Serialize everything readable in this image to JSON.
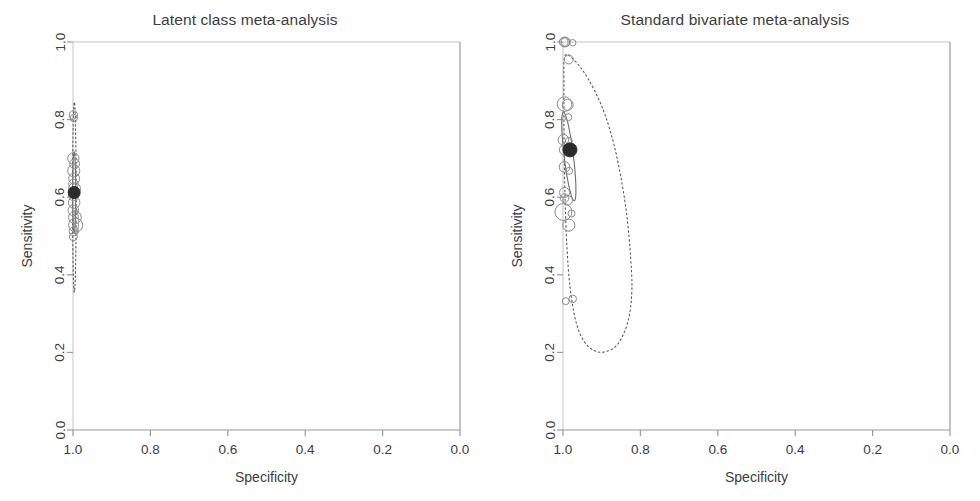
{
  "figure": {
    "width": 980,
    "height": 501,
    "background": "#ffffff",
    "panel_count": 2
  },
  "panels": [
    {
      "id": "latent-class",
      "title": "Latent class meta-analysis",
      "xlabel": "Specificity",
      "ylabel": "Sensitivity"
    },
    {
      "id": "standard-bivariate",
      "title": "Standard bivariate meta-analysis",
      "xlabel": "Specificity",
      "ylabel": "Sensitivity"
    }
  ],
  "axes": {
    "x_ticks": [
      "1.0",
      "0.8",
      "0.6",
      "0.4",
      "0.2",
      "0.0"
    ],
    "x_tick_values": [
      1.0,
      0.8,
      0.6,
      0.4,
      0.2,
      0.0
    ],
    "y_ticks": [
      "0.0",
      "0.2",
      "0.4",
      "0.6",
      "0.8",
      "1.0"
    ],
    "y_tick_values": [
      0.0,
      0.2,
      0.4,
      0.6,
      0.8,
      1.0
    ],
    "x_reversed": true,
    "xlim": [
      1.0,
      0.0
    ],
    "ylim": [
      0.0,
      1.0
    ],
    "grid": false,
    "axis_color": "#9a9a9a",
    "text_color": "#3d3d3d"
  },
  "chart_data": [
    {
      "type": "scatter",
      "id": "latent-class",
      "title": "Latent class meta-analysis",
      "xlabel": "Specificity",
      "ylabel": "Sensitivity",
      "xlim": [
        1.0,
        0.0
      ],
      "ylim": [
        0.0,
        1.0
      ],
      "x_reversed": true,
      "grid": false,
      "legend": "none",
      "notes": "SROC plot. Study circles sized by study weight, summary operating point (filled), 95% confidence ellipse (solid), 95% prediction region (dotted).",
      "summary_point": {
        "specificity": 0.997,
        "sensitivity": 0.612,
        "marker": "filled-circle",
        "color": "#2b2b2b",
        "radius_px": 6
      },
      "confidence_region": {
        "style": "solid",
        "color": "#6f6f6f",
        "center": [
          0.997,
          0.612
        ],
        "spec_half_width": 0.004,
        "sens_half_height": 0.105
      },
      "prediction_region": {
        "style": "dotted",
        "color": "#5a5a5a",
        "center": [
          0.9965,
          0.6
        ],
        "spec_half_width": 0.0085,
        "sens_half_height": 0.245,
        "sens_range": [
          0.34,
          0.81
        ]
      },
      "series": [
        {
          "name": "studies",
          "points": [
            {
              "specificity": 0.999,
              "sensitivity": 0.812,
              "weight": 0.8
            },
            {
              "specificity": 0.998,
              "sensitivity": 0.804,
              "weight": 0.5
            },
            {
              "specificity": 0.999,
              "sensitivity": 0.7,
              "weight": 2.4
            },
            {
              "specificity": 0.996,
              "sensitivity": 0.686,
              "weight": 1.6
            },
            {
              "specificity": 0.998,
              "sensitivity": 0.668,
              "weight": 3.0
            },
            {
              "specificity": 0.997,
              "sensitivity": 0.648,
              "weight": 2.2
            },
            {
              "specificity": 0.999,
              "sensitivity": 0.634,
              "weight": 1.4
            },
            {
              "specificity": 0.996,
              "sensitivity": 0.622,
              "weight": 2.8
            },
            {
              "specificity": 0.998,
              "sensitivity": 0.604,
              "weight": 1.8
            },
            {
              "specificity": 0.997,
              "sensitivity": 0.586,
              "weight": 2.6
            },
            {
              "specificity": 0.999,
              "sensitivity": 0.566,
              "weight": 2.0
            },
            {
              "specificity": 0.995,
              "sensitivity": 0.548,
              "weight": 3.4
            },
            {
              "specificity": 0.993,
              "sensitivity": 0.528,
              "weight": 4.6
            },
            {
              "specificity": 0.998,
              "sensitivity": 0.512,
              "weight": 1.2
            },
            {
              "specificity": 0.999,
              "sensitivity": 0.498,
              "weight": 0.7
            }
          ]
        }
      ]
    },
    {
      "type": "scatter",
      "id": "standard-bivariate",
      "title": "Standard bivariate meta-analysis",
      "xlabel": "Specificity",
      "ylabel": "Sensitivity",
      "xlim": [
        1.0,
        0.0
      ],
      "ylim": [
        0.0,
        1.0
      ],
      "x_reversed": true,
      "grid": false,
      "legend": "none",
      "notes": "SROC plot. Study circles sized by study weight, summary operating point (filled), 95% confidence ellipse (solid, tilted), wide 95% prediction region (dotted) reaching specificity ~0.82 and sensitivity ~0.20.",
      "summary_point": {
        "specificity": 0.982,
        "sensitivity": 0.722,
        "marker": "filled-circle",
        "color": "#2b2b2b",
        "radius_px": 7
      },
      "confidence_region": {
        "style": "solid",
        "color": "#6f6f6f",
        "center": [
          0.985,
          0.705
        ],
        "spec_half_width": 0.012,
        "sens_half_height": 0.115,
        "tilted": true
      },
      "prediction_region": {
        "style": "dotted",
        "color": "#5a5a5a",
        "center": [
          0.94,
          0.6
        ],
        "spec_range": [
          0.82,
          0.995
        ],
        "sens_range": [
          0.2,
          0.965
        ]
      },
      "series": [
        {
          "name": "studies",
          "points": [
            {
              "specificity": 0.998,
              "sensitivity": 1.0,
              "weight": 1.0
            },
            {
              "specificity": 0.996,
              "sensitivity": 1.0,
              "weight": 1.6
            },
            {
              "specificity": 0.993,
              "sensitivity": 1.0,
              "weight": 1.2
            },
            {
              "specificity": 0.975,
              "sensitivity": 0.998,
              "weight": 0.3
            },
            {
              "specificity": 0.985,
              "sensitivity": 0.955,
              "weight": 1.1
            },
            {
              "specificity": 0.996,
              "sensitivity": 0.84,
              "weight": 5.0
            },
            {
              "specificity": 0.988,
              "sensitivity": 0.838,
              "weight": 2.2
            },
            {
              "specificity": 0.986,
              "sensitivity": 0.806,
              "weight": 0.4
            },
            {
              "specificity": 0.999,
              "sensitivity": 0.748,
              "weight": 2.0
            },
            {
              "specificity": 0.985,
              "sensitivity": 0.745,
              "weight": 0.4
            },
            {
              "specificity": 0.996,
              "sensitivity": 0.722,
              "weight": 1.8
            },
            {
              "specificity": 0.996,
              "sensitivity": 0.678,
              "weight": 2.0
            },
            {
              "specificity": 0.984,
              "sensitivity": 0.668,
              "weight": 0.4
            },
            {
              "specificity": 0.996,
              "sensitivity": 0.612,
              "weight": 1.6
            },
            {
              "specificity": 0.996,
              "sensitivity": 0.598,
              "weight": 1.0
            },
            {
              "specificity": 0.988,
              "sensitivity": 0.592,
              "weight": 1.4
            },
            {
              "specificity": 0.999,
              "sensitivity": 0.562,
              "weight": 7.5
            },
            {
              "specificity": 0.978,
              "sensitivity": 0.558,
              "weight": 0.4
            },
            {
              "specificity": 0.985,
              "sensitivity": 0.528,
              "weight": 3.0
            },
            {
              "specificity": 0.975,
              "sensitivity": 0.338,
              "weight": 0.6
            },
            {
              "specificity": 0.993,
              "sensitivity": 0.332,
              "weight": 0.4
            }
          ]
        }
      ]
    }
  ]
}
